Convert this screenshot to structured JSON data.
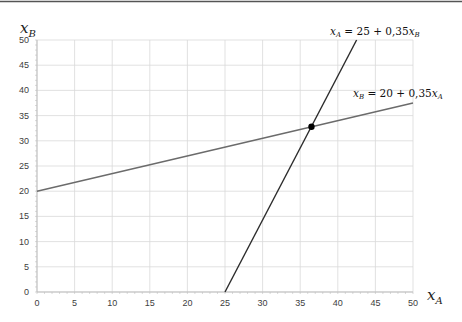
{
  "chart_data": {
    "type": "line",
    "title": "",
    "xlabel": "x_A",
    "ylabel": "x_B",
    "xlim": [
      0,
      50
    ],
    "ylim": [
      0,
      50
    ],
    "x_ticks": [
      0,
      5,
      10,
      15,
      20,
      25,
      30,
      35,
      40,
      45,
      50
    ],
    "y_ticks": [
      0,
      5,
      10,
      15,
      20,
      25,
      30,
      35,
      40,
      45,
      50
    ],
    "grid": true,
    "series": [
      {
        "name": "x_A = 25 + 0,35x_B",
        "color": "#2b2b2b",
        "points": [
          [
            25,
            0
          ],
          [
            42.5,
            50
          ]
        ]
      },
      {
        "name": "x_B = 20 + 0,35x_A",
        "color": "#6b6b6b",
        "points": [
          [
            0,
            20
          ],
          [
            50,
            37.5
          ]
        ]
      }
    ],
    "annotations": [
      {
        "type": "point",
        "label": "intersection",
        "x": 36.5,
        "y": 32.78,
        "color": "#000000"
      },
      {
        "type": "text",
        "text": "x_A = 25 + 0,35x_B"
      },
      {
        "type": "text",
        "text": "x_B = 20 + 0,35x_A"
      }
    ]
  },
  "labels": {
    "x_axis_main": "x",
    "x_axis_sub": "A",
    "y_axis_main": "x",
    "y_axis_sub": "B",
    "eq1": {
      "lhs": "x",
      "lhs_sub": "A",
      "mid": " = 25 + 0,35",
      "var": "x",
      "var_sub": "B"
    },
    "eq2": {
      "lhs": "x",
      "lhs_sub": "B",
      "mid": " = 20 + 0,35",
      "var": "x",
      "var_sub": "A"
    }
  },
  "colors": {
    "grid": "#d9d9d9",
    "axis": "#bfbfbf",
    "line_a": "#2b2b2b",
    "line_b": "#6b6b6b",
    "top_rule": "#555555"
  }
}
